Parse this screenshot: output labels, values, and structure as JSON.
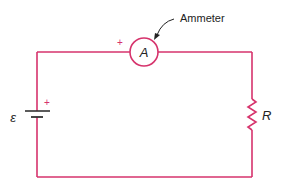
{
  "diagram": {
    "type": "circuit",
    "wire_color": "#d6336c",
    "text_color": "#222222",
    "components": {
      "ammeter": {
        "symbol": "A",
        "callout_label": "Ammeter",
        "polarity_mark": "+"
      },
      "battery": {
        "symbol": "ε",
        "polarity_mark": "+"
      },
      "resistor": {
        "symbol": "R"
      }
    }
  }
}
